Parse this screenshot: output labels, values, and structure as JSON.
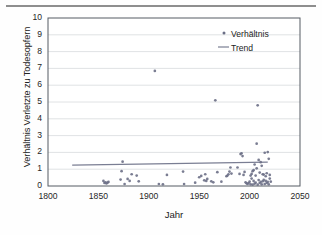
{
  "figure": {
    "has_top_rule": true,
    "background_color": "#fefefe"
  },
  "chart_data": {
    "type": "scatter",
    "title": "",
    "xlabel": "Jahr",
    "ylabel": "Verhältnis Verletzte zu Todesopfern",
    "xlim": [
      1800,
      2050
    ],
    "ylim": [
      0,
      10
    ],
    "xticks": [
      1800,
      1850,
      1900,
      1950,
      2000,
      2050
    ],
    "yticks": [
      0,
      1,
      2,
      3,
      4,
      5,
      6,
      7,
      8,
      9,
      10
    ],
    "grid": "horizontal",
    "legend_position": "top-right",
    "series": [
      {
        "name": "Verhältnis",
        "type": "scatter",
        "marker": "dot",
        "color": "#6b6f86",
        "points": [
          [
            1855,
            0.3
          ],
          [
            1856,
            0.18
          ],
          [
            1857,
            0.22
          ],
          [
            1858,
            0.15
          ],
          [
            1859,
            0.2
          ],
          [
            1860,
            0.24
          ],
          [
            1872,
            0.38
          ],
          [
            1873,
            0.88
          ],
          [
            1874,
            1.45
          ],
          [
            1876,
            0.12
          ],
          [
            1879,
            0.42
          ],
          [
            1881,
            0.3
          ],
          [
            1883,
            0.7
          ],
          [
            1888,
            0.62
          ],
          [
            1890,
            0.28
          ],
          [
            1906,
            6.85
          ],
          [
            1910,
            0.12
          ],
          [
            1914,
            0.1
          ],
          [
            1918,
            0.66
          ],
          [
            1934,
            0.86
          ],
          [
            1935,
            0.12
          ],
          [
            1946,
            0.2
          ],
          [
            1950,
            0.52
          ],
          [
            1952,
            0.6
          ],
          [
            1955,
            0.34
          ],
          [
            1956,
            0.7
          ],
          [
            1957,
            0.3
          ],
          [
            1958,
            0.42
          ],
          [
            1962,
            0.28
          ],
          [
            1964,
            0.22
          ],
          [
            1966,
            5.1
          ],
          [
            1968,
            0.82
          ],
          [
            1972,
            0.26
          ],
          [
            1977,
            0.58
          ],
          [
            1978,
            0.62
          ],
          [
            1979,
            0.7
          ],
          [
            1980,
            0.86
          ],
          [
            1981,
            1.1
          ],
          [
            1982,
            0.74
          ],
          [
            1988,
            1.1
          ],
          [
            1990,
            0.72
          ],
          [
            1991,
            1.9
          ],
          [
            1992,
            1.95
          ],
          [
            1993,
            1.78
          ],
          [
            1994,
            0.66
          ],
          [
            1995,
            0.84
          ],
          [
            1996,
            0.22
          ],
          [
            1997,
            0.16
          ],
          [
            1998,
            0.12
          ],
          [
            1999,
            0.18
          ],
          [
            2000,
            0.26
          ],
          [
            2001,
            0.1
          ],
          [
            2002,
            0.72
          ],
          [
            2003,
            0.08
          ],
          [
            2004,
            0.3
          ],
          [
            2005,
            1.28
          ],
          [
            2006,
            0.62
          ],
          [
            2007,
            2.52
          ],
          [
            2008,
            4.8
          ],
          [
            2009,
            1.55
          ],
          [
            2010,
            0.8
          ],
          [
            2011,
            0.24
          ],
          [
            2012,
            1.2
          ],
          [
            2013,
            0.7
          ],
          [
            2014,
            0.36
          ],
          [
            2015,
            1.98
          ],
          [
            2016,
            0.58
          ],
          [
            2017,
            0.18
          ],
          [
            2018,
            2.02
          ],
          [
            2019,
            1.62
          ],
          [
            2020,
            0.44
          ],
          [
            2021,
            0.26
          ],
          [
            2005,
            0.14
          ],
          [
            2006,
            0.2
          ],
          [
            2008,
            0.08
          ],
          [
            2009,
            0.35
          ],
          [
            2010,
            0.18
          ],
          [
            2012,
            0.1
          ],
          [
            2013,
            0.28
          ],
          [
            2014,
            0.68
          ],
          [
            2015,
            0.12
          ],
          [
            2016,
            0.3
          ],
          [
            2017,
            0.76
          ],
          [
            2018,
            0.24
          ],
          [
            2019,
            0.1
          ],
          [
            2020,
            0.66
          ],
          [
            2011,
            1.42
          ],
          [
            2003,
            0.88
          ],
          [
            2002,
            0.44
          ],
          [
            2001,
            0.62
          ],
          [
            2007,
            1.05
          ],
          [
            2004,
            0.94
          ]
        ]
      },
      {
        "name": "Trend",
        "type": "line",
        "color": "#7a7e93",
        "x": [
          1824,
          2018
        ],
        "y": [
          1.24,
          1.42
        ]
      }
    ]
  },
  "legend": {
    "items": [
      {
        "label": "Verhältnis",
        "marker": "dot"
      },
      {
        "label": "Trend",
        "marker": "line"
      }
    ]
  },
  "ghost_artifact": "                                        "
}
